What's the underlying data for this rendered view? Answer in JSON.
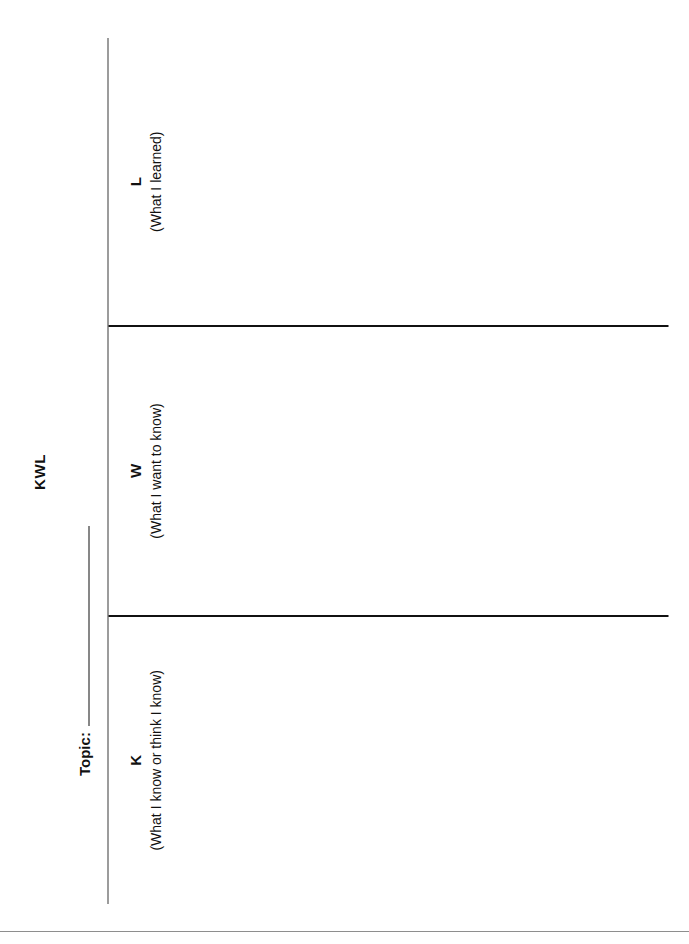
{
  "document": {
    "title": "KWL",
    "topic": {
      "label": "Topic:",
      "value": ""
    },
    "columns": [
      {
        "letter": "K",
        "subtitle": "(What I know or think I know)",
        "content": ""
      },
      {
        "letter": "W",
        "subtitle": "(What I want to know)",
        "content": ""
      },
      {
        "letter": "L",
        "subtitle": "(What I learned)",
        "content": ""
      }
    ]
  },
  "colors": {
    "ink": "#111111",
    "paper": "#ffffff",
    "rule_light": "#3a3a3a",
    "scan_edge": "#8e8e8e"
  }
}
